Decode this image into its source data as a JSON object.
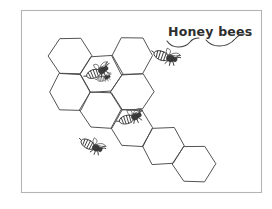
{
  "artwork": {
    "title": "Honey bees",
    "medium": "pencil sketch",
    "background_color": "#ffffff",
    "ink_color": "#2e2e2e",
    "frame": {
      "name": "drawing-border",
      "color": "#b4b4b4",
      "x": 21,
      "y": 10,
      "width": 241,
      "height": 183
    }
  },
  "label": {
    "text": "Honey bees",
    "x": 168,
    "y": 36,
    "color": "#2e2e2e",
    "underline_strokes": 2
  },
  "honeycomb": {
    "name": "hexagon-grid",
    "count": 9,
    "stroke_color": "#4a4a4a",
    "orientation": "flat-top",
    "cells": [
      {
        "id": "hex-1",
        "cx": 70,
        "cy": 56,
        "r": 21
      },
      {
        "id": "hex-2",
        "cx": 70,
        "cy": 92,
        "r": 21
      },
      {
        "id": "hex-3",
        "cx": 101,
        "cy": 74,
        "r": 21
      },
      {
        "id": "hex-4",
        "cx": 101,
        "cy": 110,
        "r": 21
      },
      {
        "id": "hex-5",
        "cx": 132,
        "cy": 56,
        "r": 21
      },
      {
        "id": "hex-6",
        "cx": 132,
        "cy": 92,
        "r": 21
      },
      {
        "id": "hex-7",
        "cx": 132,
        "cy": 128,
        "r": 21
      },
      {
        "id": "hex-8",
        "cx": 163,
        "cy": 146,
        "r": 21
      },
      {
        "id": "hex-9",
        "cx": 194,
        "cy": 164,
        "r": 21
      }
    ]
  },
  "bees": {
    "name": "bee-figures",
    "count": 5,
    "items": [
      {
        "id": "bee-1",
        "position": "on upper-centre comb cell",
        "x": 98,
        "y": 72,
        "rotation": -18,
        "scale": 1.0
      },
      {
        "id": "bee-2",
        "position": "flying at upper right",
        "x": 166,
        "y": 57,
        "rotation": 22,
        "scale": 1.05
      },
      {
        "id": "bee-3",
        "position": "on middle-right comb cell",
        "x": 131,
        "y": 118,
        "rotation": -14,
        "scale": 1.0
      },
      {
        "id": "bee-4",
        "position": "on left-lower comb edge",
        "x": 92,
        "y": 146,
        "rotation": 30,
        "scale": 1.0
      },
      {
        "id": "bee-5",
        "position": "small detail near bee-1",
        "x": 104,
        "y": 78,
        "rotation": -10,
        "scale": 0.6
      }
    ]
  }
}
